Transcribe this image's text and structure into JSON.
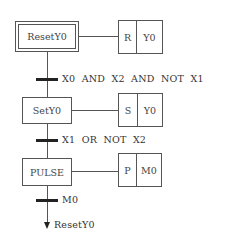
{
  "diagram": {
    "type": "SFC / GRAFCET",
    "steps": [
      {
        "name": "ResetY0",
        "initial": true,
        "action": {
          "qualifier": "R",
          "variable": "Y0"
        }
      },
      {
        "name": "SetY0",
        "initial": false,
        "action": {
          "qualifier": "S",
          "variable": "Y0"
        }
      },
      {
        "name": "PULSE",
        "initial": false,
        "action": {
          "qualifier": "P",
          "variable": "M0"
        }
      }
    ],
    "transitions": [
      {
        "condition": "X0  AND  X2  AND  NOT  X1"
      },
      {
        "condition": "X1  OR  NOT  X2"
      },
      {
        "condition": "M0"
      }
    ],
    "jump_target": "ResetY0"
  }
}
